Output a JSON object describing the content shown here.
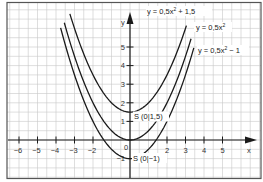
{
  "chart_data": {
    "type": "line",
    "title": "",
    "xlabel": "x",
    "ylabel": "y",
    "xlim": [
      -6.5,
      7.0
    ],
    "ylim": [
      -2.1,
      7.4
    ],
    "grid": true,
    "grid_step": 0.5,
    "x_ticks": [
      -6,
      -5,
      -4,
      -3,
      -2,
      2,
      3,
      4,
      5
    ],
    "x_tick_labels": [
      "−6",
      "−5",
      "−4",
      "−3",
      "−2",
      "2",
      "3",
      "4",
      "5"
    ],
    "y_ticks": [
      1,
      2,
      3,
      4,
      5,
      -1
    ],
    "y_tick_labels": [
      "1",
      "2",
      "3",
      "4",
      "5",
      "−1"
    ],
    "origin_label": "0",
    "series": [
      {
        "name": "y = 0,5x² + 1,5",
        "a": 0.5,
        "c": 1.5,
        "x_range": [
          -3.25,
          3.05
        ]
      },
      {
        "name": "y = 0,5x²",
        "a": 0.5,
        "c": 0,
        "x_range": [
          -3.55,
          3.3
        ]
      },
      {
        "name": "y = 0,5x² − 1",
        "a": 0.5,
        "c": -1,
        "x_range": [
          -3.75,
          3.45
        ]
      }
    ],
    "annotations": [
      {
        "text": "S (0|1,5)",
        "x": 0,
        "y": 1.5
      },
      {
        "text": "S (0|−1)",
        "x": 0,
        "y": -1
      }
    ],
    "legend_position": "inline-labels-top-right"
  },
  "labels": {
    "eq1_main": "y = 0,5x",
    "eq1_sup": "2",
    "eq1_tail": " + 1,5",
    "eq2_main": "y = 0,5x",
    "eq2_sup": "2",
    "eq3_main": "y = 0,5x",
    "eq3_sup": "2",
    "eq3_tail": " − 1",
    "vertex1": "S (0|1,5)",
    "vertex2": "S (0|−1)",
    "x_axis": "x",
    "y_axis": "y",
    "origin": "0"
  },
  "colors": {
    "grid": "#c8c8c8",
    "axis": "#1a1a1a",
    "curve": "#1a1a1a",
    "frame": "#555555"
  }
}
